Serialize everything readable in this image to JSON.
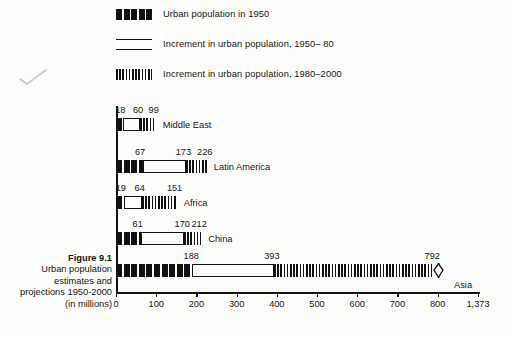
{
  "figure": {
    "number": "Figure 9.1",
    "caption_lines": [
      "Urban population",
      "estimates and",
      "projections 1950-2000",
      "(in millions)"
    ]
  },
  "legend": {
    "items": [
      {
        "key": "pop1950",
        "label": "Urban population in 1950",
        "swatch": "solid-blocks-swatch"
      },
      {
        "key": "inc5080",
        "label": "Increment in urban population, 1950– 80",
        "swatch": "hollow-bar-swatch"
      },
      {
        "key": "inc802000",
        "label": "Increment in urban population, 1980–2000",
        "swatch": "hatched-bar-swatch"
      }
    ]
  },
  "chart_data": {
    "type": "bar",
    "orientation": "horizontal",
    "stacked": true,
    "xlabel": "(in millions)",
    "ylabel": "",
    "xlim": [
      0,
      1373
    ],
    "grid": false,
    "legend_position": "top-left",
    "axis_break": {
      "after": 800,
      "to": 1373,
      "note": "scale break between 800 and 1,373"
    },
    "xticks": [
      0,
      100,
      200,
      300,
      400,
      500,
      600,
      700,
      800,
      1373
    ],
    "xticklabels": [
      "0",
      "100",
      "200",
      "300",
      "400",
      "500",
      "600",
      "700",
      "800",
      "1,373"
    ],
    "categories": [
      "Middle East",
      "Latin America",
      "Africa",
      "China",
      "Asia"
    ],
    "series": [
      {
        "name": "Urban population in 1950",
        "values": [
          18,
          67,
          19,
          61,
          188
        ]
      },
      {
        "name": "Increment in urban population, 1950– 80",
        "values": [
          42,
          106,
          45,
          109,
          205
        ]
      },
      {
        "name": "Increment in urban population, 1980–2000",
        "values": [
          39,
          53,
          87,
          42,
          399
        ]
      }
    ],
    "cumulative_labels": [
      {
        "category": "Middle East",
        "labels": [
          "18",
          "60",
          "99"
        ],
        "at": [
          18,
          60,
          99
        ]
      },
      {
        "category": "Latin America",
        "labels": [
          "67",
          "173",
          "226"
        ],
        "at": [
          67,
          173,
          226
        ]
      },
      {
        "category": "Africa",
        "labels": [
          "19",
          "64",
          "151"
        ],
        "at": [
          19,
          64,
          151
        ]
      },
      {
        "category": "China",
        "labels": [
          "61",
          "170",
          "212"
        ],
        "at": [
          61,
          170,
          212
        ]
      },
      {
        "category": "Asia",
        "labels": [
          "188",
          "393",
          "792"
        ],
        "at": [
          188,
          393,
          792
        ]
      }
    ]
  },
  "annotations": {
    "pencil_check": "hand-drawn check mark"
  }
}
